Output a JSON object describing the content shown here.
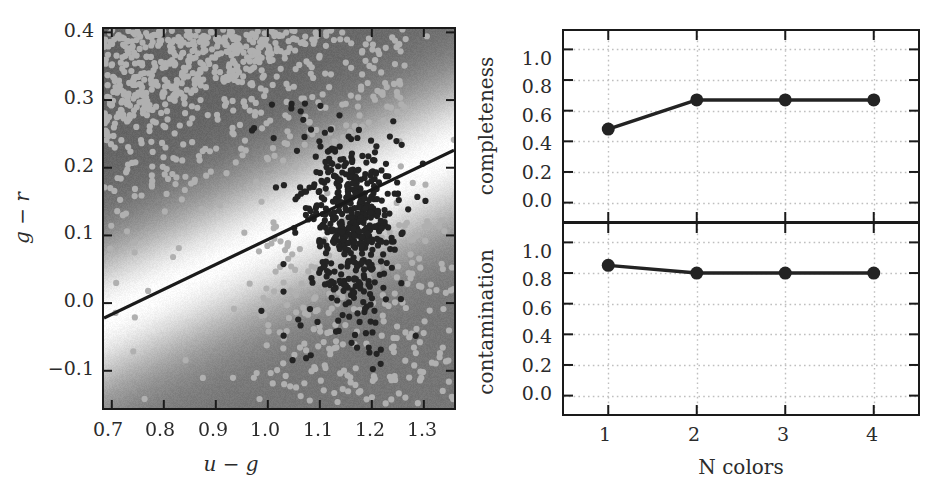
{
  "figure": {
    "background_color": "#ffffff",
    "foreground_color": "#1a1a1a",
    "point_dark_color": "#232323",
    "point_light_color": "#b0b0b0",
    "gridline_color": "#bfbfbf",
    "boundary_line_color": "#1a1a1a"
  },
  "chart_data": [
    {
      "type": "scatter",
      "panel": "left",
      "title": "",
      "xlabel": "u - g",
      "ylabel": "g - r",
      "xlim": [
        0.685,
        1.358
      ],
      "ylim": [
        -0.155,
        0.405
      ],
      "xticks": [
        0.7,
        0.8,
        0.9,
        1.0,
        1.1,
        1.2,
        1.3
      ],
      "xticklabels": [
        "0.7",
        "0.8",
        "0.9",
        "1.0",
        "1.1",
        "1.2",
        "1.3"
      ],
      "yticks": [
        -0.1,
        0.0,
        0.1,
        0.2,
        0.3,
        0.4
      ],
      "yticklabels": [
        "-0.1",
        "0.0",
        "0.1",
        "0.2",
        "0.3",
        "0.4"
      ],
      "grid": false,
      "legend": "none",
      "background_image": {
        "kind": "grayscale-decision-density",
        "description": "grayscale probability/decision map, light band along linear boundary, gray on both far sides"
      },
      "decision_boundary": {
        "kind": "line",
        "x0": 0.685,
        "y0": -0.022,
        "x1": 1.358,
        "y1": 0.226,
        "slope": 0.368,
        "intercept": -0.274
      },
      "series": [
        {
          "name": "background-sources",
          "color": "#b0b0b0",
          "marker": "o",
          "marker_size": 6,
          "n_points": 1500,
          "note": "dense saturated band across upper-left, sparse elsewhere"
        },
        {
          "name": "quasars",
          "color": "#232323",
          "marker": "o",
          "marker_size": 6,
          "n_points": 520,
          "note": "tight cluster centred near u-g = 1.16, g-r = 0.13"
        }
      ]
    },
    {
      "type": "line",
      "panel": "top-right",
      "title": "",
      "xlabel": "",
      "ylabel": "completeness",
      "x": [
        1,
        2,
        3,
        4
      ],
      "categories": [
        "1",
        "2",
        "3",
        "4"
      ],
      "values": [
        0.48,
        0.67,
        0.67,
        0.67
      ],
      "xlim": [
        0.5,
        4.5
      ],
      "ylim": [
        -0.12,
        1.12
      ],
      "xticks": [
        1,
        2,
        3,
        4
      ],
      "xticklabels": [
        "",
        "",
        "",
        ""
      ],
      "yticks": [
        0.0,
        0.2,
        0.4,
        0.6,
        0.8,
        1.0
      ],
      "yticklabels": [
        "0.0",
        "0.2",
        "0.4",
        "0.6",
        "0.8",
        "1.0"
      ],
      "grid": true,
      "grid_style": "dotted",
      "legend": "none",
      "marker": "o",
      "marker_size": 13,
      "line_width": 3.5,
      "color": "#232323"
    },
    {
      "type": "line",
      "panel": "bottom-right",
      "title": "",
      "xlabel": "N colors",
      "ylabel": "contamination",
      "x": [
        1,
        2,
        3,
        4
      ],
      "categories": [
        "1",
        "2",
        "3",
        "4"
      ],
      "values": [
        0.85,
        0.8,
        0.8,
        0.8
      ],
      "xlim": [
        0.5,
        4.5
      ],
      "ylim": [
        -0.12,
        1.12
      ],
      "xticks": [
        1,
        2,
        3,
        4
      ],
      "xticklabels": [
        "1",
        "2",
        "3",
        "4"
      ],
      "yticks": [
        0.0,
        0.2,
        0.4,
        0.6,
        0.8,
        1.0
      ],
      "yticklabels": [
        "0.0",
        "0.2",
        "0.4",
        "0.6",
        "0.8",
        "1.0"
      ],
      "grid": true,
      "grid_style": "dotted",
      "legend": "none",
      "marker": "o",
      "marker_size": 13,
      "line_width": 3.5,
      "color": "#232323"
    }
  ],
  "left_axis": {
    "xlabel_parts": {
      "a": "u",
      "op": " − ",
      "b": "g"
    },
    "ylabel_parts": {
      "a": "g",
      "op": " − ",
      "b": "r"
    },
    "xticklabels": [
      "0.7",
      "0.8",
      "0.9",
      "1.0",
      "1.1",
      "1.2",
      "1.3"
    ],
    "yticklabels": [
      "0.4",
      "0.3",
      "0.2",
      "0.1",
      "0.0",
      "−0.1"
    ]
  },
  "completeness_axis": {
    "ylabel": "completeness",
    "yticklabels": [
      "1.0",
      "0.8",
      "0.6",
      "0.4",
      "0.2",
      "0.0"
    ]
  },
  "contamination_axis": {
    "ylabel": "contamination",
    "xlabel": "N colors",
    "yticklabels": [
      "1.0",
      "0.8",
      "0.6",
      "0.4",
      "0.2",
      "0.0"
    ],
    "xticklabels": [
      "1",
      "2",
      "3",
      "4"
    ]
  }
}
